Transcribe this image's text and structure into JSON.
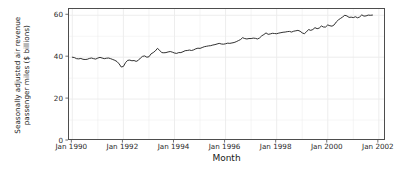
{
  "chart_data": {
    "type": "line",
    "title": "",
    "xlabel": "Month",
    "ylabel": "Seasonally adjusted air revenue passenger miles ($ billions)",
    "ylabel_line1": "Seasonally adjusted air revenue",
    "ylabel_line2": "passenger miles ($ billions)",
    "ylim": [
      0,
      63
    ],
    "xlim": [
      "Jan 1990",
      "Jul 2002"
    ],
    "y_ticks": [
      0,
      20,
      40,
      60
    ],
    "y_tick_labels": [
      "0",
      "20",
      "40",
      "60"
    ],
    "x_ticks": [
      "Jan 1990",
      "Jan 1992",
      "Jan 1994",
      "Jan 1996",
      "Jan 1998",
      "Jan 2000",
      "Jan 2002"
    ],
    "x_tick_years": [
      1990,
      1992,
      1994,
      1996,
      1998,
      2000,
      2002
    ],
    "grid": true,
    "grid_minor": true,
    "legend": "none",
    "line_color": "#1a1a1a",
    "line_width": 0.9,
    "panel_background": "#ffffff",
    "grid_color": "#ebebeb",
    "axis_color": "#4d4d4d",
    "series": [
      {
        "name": "Seasonally adjusted air revenue passenger miles",
        "x_start": 1990.0,
        "x_step_years": 0.08333,
        "values": [
          40.0,
          39.8,
          39.3,
          39.2,
          39.4,
          39.0,
          38.9,
          39.0,
          39.4,
          39.6,
          39.3,
          39.1,
          39.6,
          39.9,
          39.6,
          39.3,
          39.5,
          39.6,
          39.3,
          38.9,
          38.5,
          37.9,
          36.8,
          35.3,
          35.6,
          37.4,
          38.5,
          38.6,
          38.3,
          38.4,
          38.0,
          38.5,
          39.6,
          40.4,
          40.6,
          40.0,
          40.2,
          41.6,
          42.2,
          43.0,
          44.2,
          43.3,
          42.2,
          42.1,
          42.2,
          42.5,
          42.7,
          42.4,
          42.0,
          41.8,
          42.2,
          42.2,
          42.6,
          43.1,
          43.2,
          43.4,
          43.2,
          43.5,
          44.0,
          44.3,
          44.2,
          44.6,
          45.0,
          45.2,
          45.4,
          45.5,
          45.8,
          46.0,
          46.3,
          46.6,
          46.3,
          46.2,
          46.4,
          46.7,
          46.6,
          46.8,
          47.0,
          47.4,
          47.9,
          48.4,
          49.3,
          48.9,
          48.7,
          48.9,
          48.9,
          49.1,
          49.0,
          48.7,
          49.2,
          50.2,
          50.8,
          51.6,
          50.9,
          51.1,
          51.4,
          51.3,
          51.2,
          51.5,
          51.7,
          51.9,
          52.0,
          52.2,
          52.3,
          52.0,
          52.4,
          52.6,
          52.8,
          52.4,
          51.6,
          51.2,
          52.1,
          53.2,
          52.8,
          53.2,
          54.1,
          53.6,
          53.9,
          54.9,
          54.4,
          54.4,
          55.4,
          55.0,
          54.8,
          55.4,
          56.8,
          57.8,
          58.5,
          59.2,
          60.0,
          59.7,
          59.0,
          59.1,
          58.9,
          59.3,
          58.8,
          59.2,
          60.2,
          59.6,
          59.7,
          60.1,
          60.0,
          60.1
        ]
      }
    ]
  }
}
